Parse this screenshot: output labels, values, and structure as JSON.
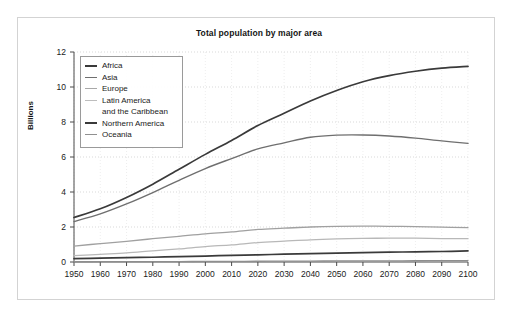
{
  "figure": {
    "title": "Total population by major area",
    "ylabel": "Billions"
  },
  "chart_data": {
    "type": "line",
    "title": "Total population by major area",
    "xlabel": "",
    "ylabel": "Billions",
    "xlim": [
      1950,
      2100
    ],
    "ylim": [
      0,
      12
    ],
    "yticks": [
      0,
      2,
      4,
      6,
      8,
      10,
      12
    ],
    "xticks": [
      1950,
      1960,
      1970,
      1980,
      1990,
      2000,
      2010,
      2020,
      2030,
      2040,
      2050,
      2060,
      2070,
      2080,
      2090,
      2100
    ],
    "grid": true,
    "legend_position": "upper left",
    "x": [
      1950,
      1960,
      1970,
      1980,
      1990,
      2000,
      2010,
      2020,
      2030,
      2040,
      2050,
      2060,
      2070,
      2080,
      2090,
      2100
    ],
    "series": [
      {
        "name": "Africa",
        "color": "#3a3a3a",
        "width": 1.6,
        "values": [
          0.23,
          0.29,
          0.37,
          0.48,
          0.63,
          0.81,
          1.04,
          1.34,
          1.69,
          2.07,
          2.48,
          2.88,
          3.26,
          3.6,
          3.9,
          4.18
        ]
      },
      {
        "name": "Asia",
        "color": "#6b6b6b",
        "width": 1.3,
        "values": [
          1.4,
          1.7,
          2.14,
          2.64,
          3.2,
          3.73,
          4.19,
          4.6,
          4.92,
          5.1,
          5.17,
          5.15,
          5.05,
          4.9,
          4.72,
          4.55
        ]
      },
      {
        "name": "Europe",
        "color": "#9c9c9c",
        "width": 1.2,
        "values": [
          0.55,
          0.61,
          0.66,
          0.69,
          0.72,
          0.73,
          0.74,
          0.75,
          0.74,
          0.73,
          0.72,
          0.7,
          0.68,
          0.66,
          0.64,
          0.63
        ]
      },
      {
        "name": "Latin America and the Caribbean",
        "color": "#b5b5b5",
        "width": 1.2,
        "values": [
          0.17,
          0.22,
          0.29,
          0.36,
          0.44,
          0.52,
          0.59,
          0.65,
          0.71,
          0.75,
          0.78,
          0.79,
          0.79,
          0.78,
          0.76,
          0.73
        ]
      },
      {
        "name": "Northern America",
        "color": "#3a3a3a",
        "width": 1.6,
        "values": [
          0.17,
          0.2,
          0.23,
          0.25,
          0.28,
          0.31,
          0.34,
          0.37,
          0.4,
          0.43,
          0.45,
          0.47,
          0.49,
          0.51,
          0.53,
          0.55
        ]
      },
      {
        "name": "Oceania",
        "color": "#8a8a8a",
        "width": 1.2,
        "values": [
          0.013,
          0.016,
          0.02,
          0.023,
          0.027,
          0.031,
          0.037,
          0.043,
          0.049,
          0.055,
          0.06,
          0.064,
          0.068,
          0.072,
          0.075,
          0.078
        ]
      }
    ],
    "stacked_totals_note": "lines drawn are cumulative stacked totals",
    "plotted_curves": [
      {
        "name": "total-all-areas",
        "legend": "Africa",
        "color": "#3a3a3a",
        "width": 1.7,
        "values": [
          2.54,
          3.04,
          3.69,
          4.45,
          5.3,
          6.15,
          6.95,
          7.8,
          8.5,
          9.2,
          9.8,
          10.3,
          10.65,
          10.9,
          11.08,
          11.18
        ]
      },
      {
        "name": "asia-plus-below",
        "legend": "Asia",
        "color": "#6f6f6f",
        "width": 1.4,
        "values": [
          2.31,
          2.75,
          3.32,
          3.97,
          4.67,
          5.34,
          5.91,
          6.46,
          6.81,
          7.13,
          7.25,
          7.26,
          7.2,
          7.08,
          6.92,
          6.78
        ]
      },
      {
        "name": "europe-plus-below",
        "legend": "Europe",
        "color": "#a0a0a0",
        "width": 1.3,
        "values": [
          0.91,
          1.05,
          1.18,
          1.33,
          1.47,
          1.61,
          1.72,
          1.86,
          1.93,
          2.0,
          2.04,
          2.05,
          2.04,
          2.02,
          1.99,
          1.96
        ]
      },
      {
        "name": "latin-america-plus-below",
        "legend": "Latin America and the Caribbean",
        "color": "#b8b8b8",
        "width": 1.3,
        "values": [
          0.36,
          0.44,
          0.52,
          0.64,
          0.75,
          0.88,
          0.98,
          1.11,
          1.19,
          1.27,
          1.32,
          1.35,
          1.36,
          1.36,
          1.34,
          1.33
        ]
      },
      {
        "name": "northern-america-plus-oceania",
        "legend": "Northern America",
        "color": "#3a3a3a",
        "width": 1.7,
        "values": [
          0.19,
          0.22,
          0.25,
          0.27,
          0.31,
          0.34,
          0.38,
          0.41,
          0.45,
          0.48,
          0.51,
          0.53,
          0.56,
          0.58,
          0.6,
          0.63
        ]
      },
      {
        "name": "oceania",
        "legend": "Oceania",
        "color": "#8e8e8e",
        "width": 1.3,
        "values": [
          0.013,
          0.016,
          0.02,
          0.023,
          0.027,
          0.031,
          0.037,
          0.043,
          0.049,
          0.055,
          0.06,
          0.064,
          0.068,
          0.072,
          0.075,
          0.078
        ]
      }
    ]
  },
  "legend": {
    "items": [
      {
        "label": "Africa",
        "color": "#3a3a3a",
        "width": 2.0
      },
      {
        "label": "Asia",
        "color": "#6f6f6f",
        "width": 1.6
      },
      {
        "label": "Europe",
        "color": "#a8a8a8",
        "width": 1.5
      },
      {
        "label": "Latin America",
        "label2": "and the Caribbean",
        "color": "#bdbdbd",
        "width": 1.5
      },
      {
        "label": "Northern America",
        "color": "#3a3a3a",
        "width": 2.0
      },
      {
        "label": "Oceania",
        "color": "#909090",
        "width": 1.5
      }
    ]
  }
}
